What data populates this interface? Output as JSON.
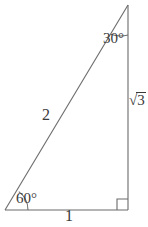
{
  "figure": {
    "type": "geometry-diagram",
    "shape": "right-triangle",
    "background_color": "#ffffff",
    "stroke_color": "#6b6b6b",
    "text_color": "#3a3a3a",
    "vertices": {
      "apex": {
        "x": 128,
        "y": 5
      },
      "bottom_left": {
        "x": 5,
        "y": 210
      },
      "bottom_right": {
        "x": 128,
        "y": 210
      }
    },
    "angles": {
      "apex_label": "30°",
      "bottom_left_label": "60°",
      "bottom_right_label": "right-angle-marker"
    },
    "sides": {
      "hypotenuse_label": "2",
      "vertical_label_radical": "√",
      "vertical_label_radicand": "3",
      "base_label": "1"
    }
  }
}
